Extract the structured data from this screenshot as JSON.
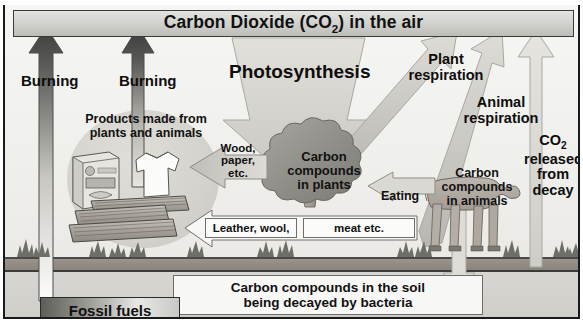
{
  "diagram": {
    "banner": {
      "label_before": "Carbon Dioxide (CO",
      "label_sub": "2",
      "label_after": ") in the air"
    },
    "colors": {
      "frame_border": "#1a1a1a",
      "sky": "#f1f1ee",
      "banner_gradient_light": "#e3e3e0",
      "banner_gradient_dark": "#bdbdb8",
      "soil": "#8a847c",
      "subsoil": "#d4d2ce",
      "dark_arrow": "#4a4a48",
      "light_arrow": "#dcdad4",
      "mid_arrow": "#b9b7b1",
      "tree_canopy": "#9a9892",
      "tree_trunk": "#a8a29a",
      "cow_body": "#b0aaa2",
      "grass": "#6e6e68",
      "text": "#0d0d0d"
    },
    "labels": {
      "burning_left": "Burning",
      "burning_right": "Burning",
      "photosynthesis": "Photosynthesis",
      "plant_respiration_line1": "Plant",
      "plant_respiration_line2": "respiration",
      "animal_respiration_line1": "Animal",
      "animal_respiration_line2": "respiration",
      "co2_decay_line1_before": "CO",
      "co2_decay_line1_sub": "2",
      "co2_decay_line2": "released",
      "co2_decay_line3": "from",
      "co2_decay_line4": "decay",
      "products_line1": "Products made from",
      "products_line2": "plants and animals",
      "wood_line1": "Wood,",
      "wood_line2": "paper,",
      "wood_line3": "etc.",
      "eating": "Eating",
      "leather_wool": "Leather, wool,",
      "meat_etc": "meat etc.",
      "carbon_plants_line1": "Carbon",
      "carbon_plants_line2": "compounds",
      "carbon_plants_line3": "in plants",
      "carbon_animals_line1": "Carbon",
      "carbon_animals_line2": "compounds",
      "carbon_animals_line3": "in animals",
      "soil_line1": "Carbon compounds in the soil",
      "soil_line2": "being decayed by bacteria",
      "fossil_fuels": "Fossil fuels"
    },
    "objects": {
      "cereal_box": "cereal-box",
      "shirt": "shirt",
      "wood_planks": "wood-planks",
      "tree": "tree",
      "cow": "cow"
    },
    "flows": [
      {
        "name": "burning-fossil-fuels-to-air",
        "label": "Burning",
        "from": "Fossil fuels",
        "to": "Carbon Dioxide (CO2) in the air",
        "direction": "up"
      },
      {
        "name": "burning-products-to-air",
        "label": "Burning",
        "from": "Products made from plants and animals",
        "to": "Carbon Dioxide (CO2) in the air",
        "direction": "up"
      },
      {
        "name": "photosynthesis-air-to-plants",
        "label": "Photosynthesis",
        "from": "Carbon Dioxide (CO2) in the air",
        "to": "Carbon compounds in plants",
        "direction": "down"
      },
      {
        "name": "plant-respiration-plants-to-air",
        "label": "Plant respiration",
        "from": "Carbon compounds in plants",
        "to": "Carbon Dioxide (CO2) in the air",
        "direction": "up-right"
      },
      {
        "name": "animal-respiration-animals-to-air",
        "label": "Animal respiration",
        "from": "Carbon compounds in animals",
        "to": "Carbon Dioxide (CO2) in the air",
        "direction": "up-right"
      },
      {
        "name": "co2-released-from-decay",
        "label": "CO2 released from decay",
        "from": "Carbon compounds in the soil",
        "to": "Carbon Dioxide (CO2) in the air",
        "direction": "up"
      },
      {
        "name": "eating-plants-to-animals",
        "label": "Eating",
        "from": "Carbon compounds in plants",
        "to": "Carbon compounds in animals",
        "direction": "left"
      },
      {
        "name": "wood-paper-plants-to-products",
        "label": "Wood, paper, etc.",
        "from": "Carbon compounds in plants",
        "to": "Products made from plants and animals",
        "direction": "left"
      },
      {
        "name": "leather-wool-meat-animals-to-products",
        "label": "Leather, wool, meat etc.",
        "from": "Carbon compounds in animals",
        "to": "Products made from plants and animals",
        "direction": "left"
      },
      {
        "name": "animals-to-soil-decay",
        "label": "",
        "from": "Carbon compounds in animals",
        "to": "Carbon compounds in the soil",
        "direction": "down"
      }
    ]
  }
}
